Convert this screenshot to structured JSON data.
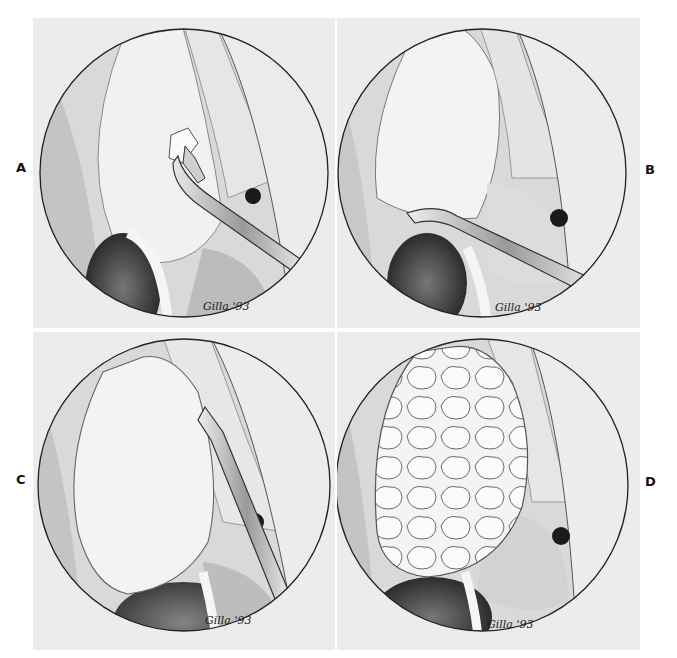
{
  "figure": {
    "panels": [
      {
        "id": "A",
        "label": "A",
        "signature": "Gilla '93",
        "instrument": "curved-forceps",
        "stage": "initial-incision"
      },
      {
        "id": "B",
        "label": "B",
        "signature": "Gilla '93",
        "instrument": "curved-dissector",
        "stage": "capsule-elevation"
      },
      {
        "id": "C",
        "label": "C",
        "signature": "Gilla '93",
        "instrument": "straight-dissector",
        "stage": "dissection"
      },
      {
        "id": "D",
        "label": "D",
        "signature": "Gilla '93",
        "instrument": "none",
        "stage": "exposed-lobulated-mass"
      }
    ],
    "colors": {
      "panel_bg": "#ececec",
      "circle_stroke": "#222222",
      "tissue_light": "#f2f2f2",
      "tissue_mid": "#bdbdbd",
      "tissue_dark": "#2b2b2b"
    }
  }
}
